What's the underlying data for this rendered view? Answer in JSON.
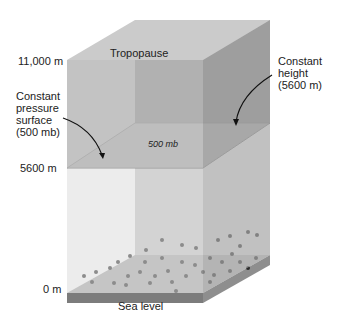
{
  "diagram": {
    "type": "3d-atmosphere-column",
    "labels": {
      "tropopause": "Tropopause",
      "height_11000": "11,000 m",
      "height_5600": "5600 m",
      "height_0": "0 m",
      "sea_level": "Sea level",
      "plane_label": "500 mb",
      "constant_pressure": [
        "Constant",
        "pressure",
        "surface",
        "(500 mb)"
      ],
      "constant_height": [
        "Constant",
        "height",
        "(5600 m)"
      ]
    },
    "colors": {
      "top_face": "#c9c9c9",
      "upper_front": "#b3b3b3",
      "upper_back": "#a2a2a2",
      "upper_side": "#9e9e9e",
      "lower_front": "#d3d3d3",
      "lower_back": "#c5c5c5",
      "lower_side": "#bcbcbc",
      "plane": "#e4e4e4",
      "ground": "#a8a8a8",
      "ground_edge": "#7f7f7f"
    }
  }
}
